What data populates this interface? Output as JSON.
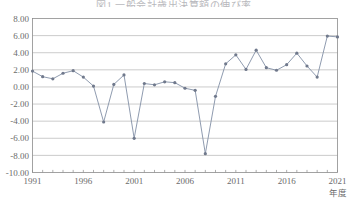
{
  "chart_data": {
    "type": "line",
    "title": "図1 一般会計歳出決算額の伸び率",
    "xlabel": "年度",
    "ylabel": "",
    "ylim": [
      -10.0,
      8.0
    ],
    "ytick_step": 2.0,
    "ytick_labels": [
      "8.00",
      "6.00",
      "4.00",
      "2.00",
      "0.00",
      "-2.00",
      "-4.00",
      "-6.00",
      "-8.00",
      "-10.00"
    ],
    "ytick_values": [
      8.0,
      6.0,
      4.0,
      2.0,
      0.0,
      -2.0,
      -4.0,
      -6.0,
      -8.0,
      -10.0
    ],
    "xtick_labels": [
      "1991",
      "1996",
      "2001",
      "2006",
      "2011",
      "2016",
      "2021"
    ],
    "xtick_values": [
      1991,
      1996,
      2001,
      2006,
      2011,
      2016,
      2021
    ],
    "xlim": [
      1991,
      2021
    ],
    "grid": true,
    "legend": false,
    "marker": "circle",
    "line_color": "#8290a6",
    "marker_color": "#70798c",
    "grid_color": "#a8a8a8",
    "frame_color": "#8c8c8c",
    "background": "#ffffff",
    "x": [
      1991,
      1992,
      1993,
      1994,
      1995,
      1996,
      1997,
      1998,
      1999,
      2000,
      2001,
      2002,
      2003,
      2004,
      2005,
      2006,
      2007,
      2008,
      2009,
      2010,
      2011,
      2012,
      2013,
      2014,
      2015,
      2016,
      2017,
      2018,
      2019,
      2020,
      2021
    ],
    "categories": [
      "1991",
      "1992",
      "1993",
      "1994",
      "1995",
      "1996",
      "1997",
      "1998",
      "1999",
      "2000",
      "2001",
      "2002",
      "2003",
      "2004",
      "2005",
      "2006",
      "2007",
      "2008",
      "2009",
      "2010",
      "2011",
      "2012",
      "2013",
      "2014",
      "2015",
      "2016",
      "2017",
      "2018",
      "2019",
      "2020",
      "2021"
    ],
    "values": [
      1.85,
      1.2,
      0.95,
      1.6,
      1.9,
      1.15,
      0.1,
      -4.1,
      0.3,
      1.4,
      -6.0,
      0.4,
      0.25,
      0.6,
      0.5,
      -0.15,
      -0.4,
      -7.8,
      -1.1,
      2.7,
      3.75,
      2.05,
      4.3,
      2.25,
      1.95,
      2.6,
      3.95,
      2.45,
      1.15,
      5.95,
      5.85
    ],
    "series": [
      {
        "name": "伸び率",
        "values": [
          1.85,
          1.2,
          0.95,
          1.6,
          1.9,
          1.15,
          0.1,
          -4.1,
          0.3,
          1.4,
          -6.0,
          0.4,
          0.25,
          0.6,
          0.5,
          -0.15,
          -0.4,
          -7.8,
          -1.1,
          2.7,
          3.75,
          2.05,
          4.3,
          2.25,
          1.95,
          2.6,
          3.95,
          2.45,
          1.15,
          5.95,
          5.85
        ]
      }
    ]
  }
}
